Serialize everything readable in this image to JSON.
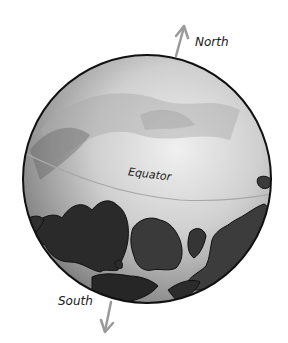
{
  "diagram": {
    "labels": {
      "north": "North",
      "south": "South",
      "equator": "Equator"
    },
    "colors": {
      "ocean_light": "#e6e6e6",
      "ocean_dark": "#6e6e6e",
      "land": "#2a2a2a",
      "outline": "#111111",
      "arrow": "#9a9a9a",
      "equator_line": "#a8a8a8"
    }
  }
}
